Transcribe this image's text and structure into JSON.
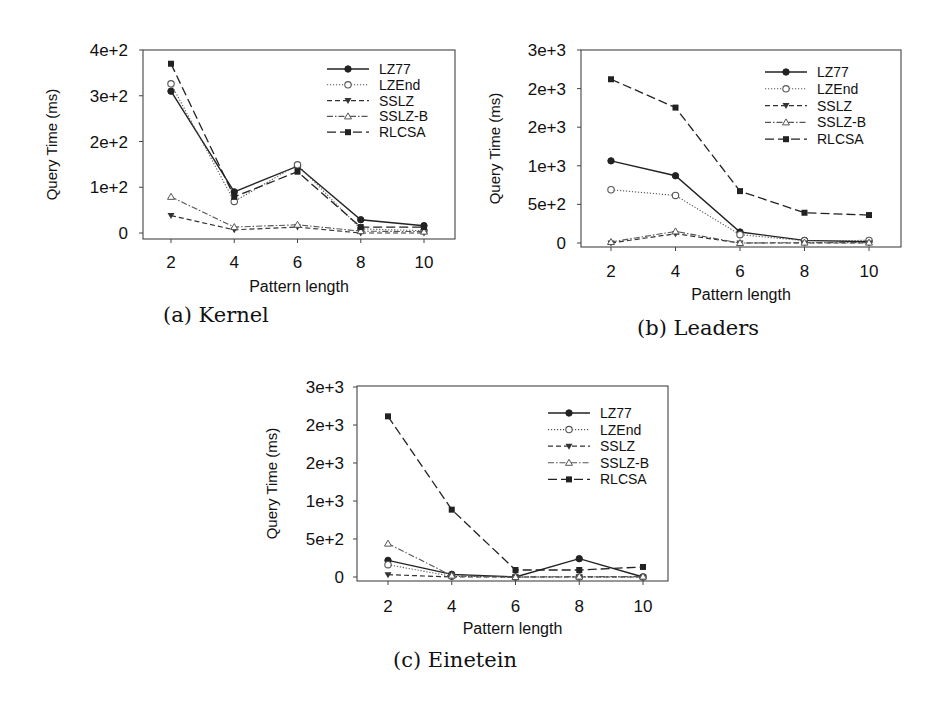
{
  "chart_data": [
    {
      "type": "line",
      "id": "a",
      "title": "",
      "caption": "(a) Kernel",
      "xlabel": "Pattern length",
      "ylabel": "Query Time (ms)",
      "x": [
        2,
        4,
        6,
        8,
        10
      ],
      "ylim": [
        0,
        400
      ],
      "yticks": [
        0,
        100,
        200,
        300,
        400
      ],
      "ytick_labels": [
        "0",
        "1e+2",
        "2e+2",
        "3e+2",
        "4e+2"
      ],
      "legend_position": "upper right",
      "grid": false,
      "series": [
        {
          "name": "LZ77",
          "values": [
            310,
            90,
            146,
            29,
            16
          ]
        },
        {
          "name": "LZEnd",
          "values": [
            326,
            69,
            149,
            9,
            5
          ]
        },
        {
          "name": "SSLZ",
          "values": [
            38,
            7,
            13,
            0,
            0
          ]
        },
        {
          "name": "SSLZ-B",
          "values": [
            79,
            13,
            18,
            4,
            3
          ]
        },
        {
          "name": "RLCSA",
          "values": [
            370,
            79,
            134,
            13,
            13
          ]
        }
      ]
    },
    {
      "type": "line",
      "id": "b",
      "title": "",
      "caption": "(b) Leaders",
      "xlabel": "Pattern length",
      "ylabel": "Query Time (ms)",
      "x": [
        2,
        4,
        6,
        8,
        10
      ],
      "ylim": [
        0,
        2500
      ],
      "yticks": [
        0,
        500,
        1000,
        1500,
        2000,
        2500
      ],
      "ytick_labels": [
        "0",
        "5e+2",
        "1e+3",
        "2e+3",
        "2e+3",
        "3e+3"
      ],
      "legend_position": "upper right",
      "grid": false,
      "series": [
        {
          "name": "LZ77",
          "values": [
            1064,
            871,
            142,
            34,
            17
          ]
        },
        {
          "name": "LZEnd",
          "values": [
            690,
            616,
            108,
            30,
            34
          ]
        },
        {
          "name": "SSLZ",
          "values": [
            0,
            120,
            0,
            0,
            0
          ]
        },
        {
          "name": "SSLZ-B",
          "values": [
            13,
            150,
            0,
            5,
            5
          ]
        },
        {
          "name": "RLCSA",
          "values": [
            2121,
            1754,
            672,
            392,
            362
          ]
        }
      ]
    },
    {
      "type": "line",
      "id": "c",
      "title": "",
      "caption": "(c) Einetein",
      "xlabel": "Pattern length",
      "ylabel": "Query Time (ms)",
      "x": [
        2,
        4,
        6,
        8,
        10
      ],
      "ylim": [
        0,
        2500
      ],
      "yticks": [
        0,
        500,
        1000,
        1500,
        2000,
        2500
      ],
      "ytick_labels": [
        "0",
        "5e+2",
        "1e+3",
        "2e+3",
        "2e+3",
        "3e+3"
      ],
      "legend_position": "upper right",
      "grid": false,
      "series": [
        {
          "name": "LZ77",
          "values": [
            219,
            35,
            0,
            241,
            0
          ]
        },
        {
          "name": "LZEnd",
          "values": [
            162,
            9,
            0,
            0,
            0
          ]
        },
        {
          "name": "SSLZ",
          "values": [
            31,
            0,
            0,
            0,
            0
          ]
        },
        {
          "name": "SSLZ-B",
          "values": [
            439,
            18,
            0,
            5,
            5
          ]
        },
        {
          "name": "RLCSA",
          "values": [
            2114,
            886,
            92,
            92,
            132
          ]
        }
      ]
    }
  ],
  "styles": {
    "LZ77": {
      "dash": "",
      "marker": "circle-filled",
      "color": "#222222",
      "width": 1.4
    },
    "LZEnd": {
      "dash": "1.2 1.8",
      "marker": "circle-open",
      "color": "#555555",
      "width": 1.1
    },
    "SSLZ": {
      "dash": "5 3",
      "marker": "triangle-down-filled",
      "color": "#333333",
      "width": 1.2
    },
    "SSLZ-B": {
      "dash": "6 2 1.5 2",
      "marker": "triangle-up-open",
      "color": "#555555",
      "width": 1.1
    },
    "RLCSA": {
      "dash": "9 4",
      "marker": "square-filled",
      "color": "#222222",
      "width": 1.3
    }
  }
}
